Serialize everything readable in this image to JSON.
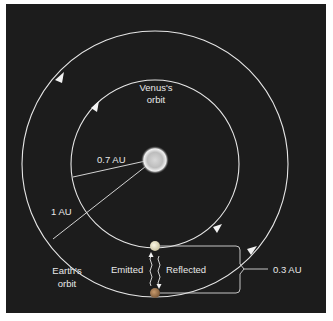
{
  "diagram": {
    "colors": {
      "background": "#1c1c1c",
      "orbit_line": "#e6e6e6",
      "sun_fill": "#d9d9d9",
      "venus_fill": "#e8e2c8",
      "earth_fill": "#a07a55",
      "text": "#e8e8e8"
    },
    "labels": {
      "venus_orbit_line1": "Venus's",
      "venus_orbit_line2": "orbit",
      "earth_orbit_line1": "Earth's",
      "earth_orbit_line2": "orbit",
      "venus_distance": "0.7 AU",
      "earth_distance": "1 AU",
      "emitted": "Emitted",
      "reflected": "Reflected",
      "separation": "0.3 AU"
    },
    "bodies": [
      {
        "name": "Sun",
        "role": "center"
      },
      {
        "name": "Venus",
        "orbit_radius_au": 0.7
      },
      {
        "name": "Earth",
        "orbit_radius_au": 1.0
      }
    ],
    "icons": {
      "sun": "sun-icon",
      "venus": "venus-planet-icon",
      "earth": "earth-planet-icon",
      "orbit_direction": "arrowhead-icon",
      "radar_signal": "wavy-signal-icon"
    }
  }
}
